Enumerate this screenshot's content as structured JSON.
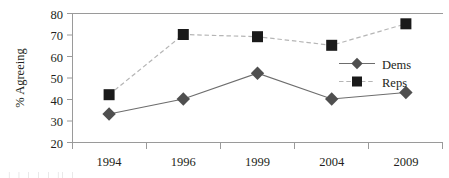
{
  "chart_data": {
    "type": "line",
    "title": "",
    "xlabel": "",
    "ylabel": "% Agreeing",
    "categories": [
      "1994",
      "1996",
      "1999",
      "2004",
      "2009"
    ],
    "ylim": [
      20,
      80
    ],
    "yticks": [
      20,
      30,
      40,
      50,
      60,
      70,
      80
    ],
    "ytick_labels": [
      "20",
      "30",
      "40",
      "50",
      "60",
      "70",
      "80"
    ],
    "grid": false,
    "legend_position": "inside-right",
    "series": [
      {
        "name": "Dems",
        "values": [
          33,
          40,
          52,
          40,
          43
        ],
        "marker": "diamond",
        "line_style": "solid",
        "color": "#6d6d6d",
        "marker_color": "#4f4f4f"
      },
      {
        "name": "Reps",
        "values": [
          42,
          70,
          69,
          65,
          75
        ],
        "marker": "square",
        "line_style": "dashed",
        "color": "#b5b5b5",
        "marker_color": "#1a1a1a"
      }
    ]
  },
  "axis": {
    "y_title": "% Agreeing",
    "y_labels": [
      "80",
      "70",
      "60",
      "50",
      "40",
      "30",
      "20"
    ],
    "x_labels": [
      "1994",
      "1996",
      "1999",
      "2004",
      "2009"
    ]
  },
  "legend": {
    "items": [
      {
        "label": "Dems",
        "marker": "diamond-marker",
        "line": "solid"
      },
      {
        "label": "Reps",
        "marker": "square-marker",
        "line": "dashed"
      }
    ]
  },
  "footer": {
    "cropped_text": "|     |   |           |   |  ||        |"
  },
  "colors": {
    "axis": "#9a9a9a",
    "text": "#231f20",
    "dems_line": "#6d6d6d",
    "dems_marker": "#4f4f4f",
    "reps_line": "#b5b5b5",
    "reps_marker": "#1a1a1a",
    "background": "#ffffff"
  }
}
